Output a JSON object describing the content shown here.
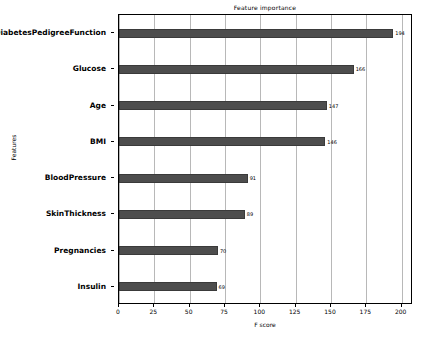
{
  "chart_data": {
    "type": "bar",
    "orientation": "horizontal",
    "title": "Feature importance",
    "xlabel": "F score",
    "ylabel": "Features",
    "categories": [
      "DiabetesPedigreeFunction",
      "Glucose",
      "Age",
      "BMI",
      "BloodPressure",
      "SkinThickness",
      "Pregnancies",
      "Insulin"
    ],
    "values": [
      194,
      166,
      147,
      146,
      91,
      89,
      70,
      69
    ],
    "value_labels": [
      "194",
      "166",
      "147",
      "146",
      "91",
      "89",
      "70",
      "69"
    ],
    "xlim": [
      0,
      208
    ],
    "xticks": [
      0,
      25,
      50,
      75,
      100,
      125,
      150,
      175,
      200
    ],
    "xtick_labels": [
      "0",
      "25",
      "50",
      "75",
      "100",
      "125",
      "150",
      "175",
      "200"
    ],
    "grid": "vertical",
    "legend": null,
    "bar_color": "#4d4d4d",
    "grid_color": "#b8b8b8",
    "axis_color": "#000000"
  }
}
